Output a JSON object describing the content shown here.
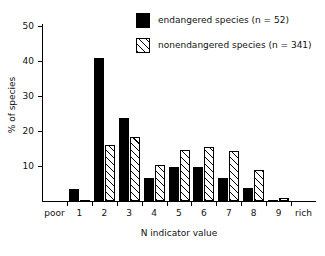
{
  "chart_data": {
    "type": "bar",
    "title": "",
    "xlabel": "N indicator value",
    "ylabel": "% of species",
    "categories": [
      "1",
      "2",
      "3",
      "4",
      "5",
      "6",
      "7",
      "8",
      "9"
    ],
    "xtick_labels": [
      "poor",
      "1",
      "2",
      "3",
      "4",
      "5",
      "6",
      "7",
      "8",
      "9",
      "rich"
    ],
    "x_axis_end_labels": {
      "low": "poor",
      "high": "rich"
    },
    "ytick_labels": [
      "10",
      "20",
      "30",
      "40",
      "50"
    ],
    "yticks": [
      10,
      20,
      30,
      40,
      50
    ],
    "ylim": [
      0,
      52
    ],
    "grid": false,
    "legend_position": "top-right",
    "series": [
      {
        "name": "endangered species (n = 52)",
        "fill": "solid-black",
        "values": [
          3.5,
          40.8,
          23.8,
          6.7,
          9.7,
          9.7,
          6.7,
          3.8,
          0.3
        ]
      },
      {
        "name": "nonendangered species (n = 341)",
        "fill": "hatched",
        "values": [
          0.3,
          16.0,
          18.2,
          10.4,
          14.7,
          15.3,
          14.4,
          8.9,
          1.0
        ]
      }
    ]
  },
  "legend": {
    "items": [
      {
        "label": "endangered species (n = 52)",
        "swatch": "solid"
      },
      {
        "label": "nonendangered species (n = 341)",
        "swatch": "hatch"
      }
    ]
  },
  "colors": {
    "endangered": "#000000",
    "nonendangered_outline": "#000000",
    "background": "#ffffff",
    "axis": "#000000"
  }
}
